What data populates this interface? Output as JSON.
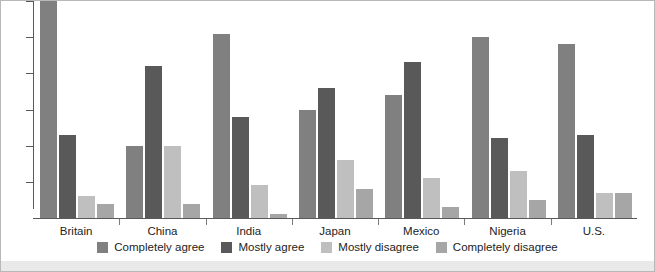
{
  "chart_data": {
    "type": "bar",
    "title": "",
    "subtitle": "",
    "xlabel": "",
    "ylabel": "",
    "ylim": [
      0,
      60
    ],
    "grid": false,
    "legend_position": "bottom",
    "y_ticks": [
      10,
      20,
      30,
      40,
      50,
      60
    ],
    "categories": [
      "Britain",
      "China",
      "India",
      "Japan",
      "Mexico",
      "Nigeria",
      "U.S."
    ],
    "series": [
      {
        "name": "Completely agree",
        "color": "#808080",
        "values": [
          60,
          20,
          51,
          30,
          34,
          50,
          48
        ]
      },
      {
        "name": "Mostly agree",
        "color": "#595959",
        "values": [
          23,
          42,
          28,
          36,
          43,
          22,
          23
        ]
      },
      {
        "name": "Mostly disagree",
        "color": "#bfbfbf",
        "values": [
          6,
          20,
          9,
          16,
          11,
          13,
          7
        ]
      },
      {
        "name": "Completely disagree",
        "color": "#a6a6a6",
        "values": [
          4,
          4,
          1,
          8,
          3,
          5,
          7
        ]
      }
    ]
  },
  "axis": {
    "tick_count": 6
  },
  "colors": {
    "axis": "#5a5a5a",
    "label": "#232323",
    "background": "#ffffff",
    "border": "#b8b8b8",
    "bottom_strip": "#e9e9e9"
  }
}
